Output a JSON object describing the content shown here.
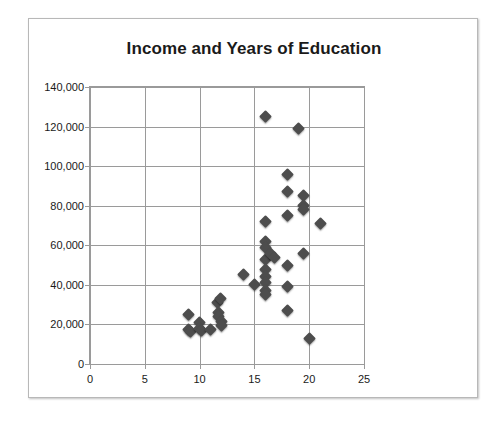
{
  "chart_data": {
    "type": "scatter",
    "title": "Income and Years of Education",
    "xlabel": "",
    "ylabel": "",
    "xlim": [
      0,
      25
    ],
    "ylim": [
      0,
      140000
    ],
    "xticks": [
      0,
      5,
      10,
      15,
      20,
      25
    ],
    "yticks": [
      0,
      20000,
      40000,
      60000,
      80000,
      100000,
      120000,
      140000
    ],
    "xtick_labels": [
      "0",
      "5",
      "10",
      "15",
      "20",
      "25"
    ],
    "ytick_labels": [
      "0",
      "20,000",
      "40,000",
      "60,000",
      "80,000",
      "100,000",
      "120,000",
      "140,000"
    ],
    "grid": true,
    "legend": false,
    "marker": "diamond",
    "marker_color": "#4d4d4d",
    "points": [
      {
        "x": 9,
        "y": 25000
      },
      {
        "x": 9,
        "y": 17500
      },
      {
        "x": 9.2,
        "y": 16500
      },
      {
        "x": 10,
        "y": 21000
      },
      {
        "x": 10,
        "y": 18000
      },
      {
        "x": 10.2,
        "y": 17000
      },
      {
        "x": 11,
        "y": 17500
      },
      {
        "x": 11.6,
        "y": 31000
      },
      {
        "x": 11.7,
        "y": 26000
      },
      {
        "x": 11.7,
        "y": 24000
      },
      {
        "x": 11.9,
        "y": 33000
      },
      {
        "x": 12,
        "y": 21500
      },
      {
        "x": 12,
        "y": 19500
      },
      {
        "x": 14,
        "y": 45000
      },
      {
        "x": 15,
        "y": 40000
      },
      {
        "x": 16,
        "y": 125000
      },
      {
        "x": 16,
        "y": 72000
      },
      {
        "x": 16,
        "y": 62000
      },
      {
        "x": 16,
        "y": 59000
      },
      {
        "x": 16,
        "y": 53000
      },
      {
        "x": 16,
        "y": 48000
      },
      {
        "x": 16,
        "y": 44000
      },
      {
        "x": 16,
        "y": 41000
      },
      {
        "x": 16,
        "y": 37000
      },
      {
        "x": 16,
        "y": 35000
      },
      {
        "x": 16.5,
        "y": 56000
      },
      {
        "x": 16.8,
        "y": 54000
      },
      {
        "x": 18,
        "y": 96000
      },
      {
        "x": 18,
        "y": 87000
      },
      {
        "x": 18,
        "y": 75000
      },
      {
        "x": 18,
        "y": 50000
      },
      {
        "x": 18,
        "y": 39000
      },
      {
        "x": 18,
        "y": 27000
      },
      {
        "x": 19,
        "y": 119000
      },
      {
        "x": 19.5,
        "y": 85000
      },
      {
        "x": 19.5,
        "y": 80000
      },
      {
        "x": 19.5,
        "y": 78000
      },
      {
        "x": 19.5,
        "y": 56000
      },
      {
        "x": 20,
        "y": 13000
      },
      {
        "x": 21,
        "y": 71000
      }
    ]
  }
}
